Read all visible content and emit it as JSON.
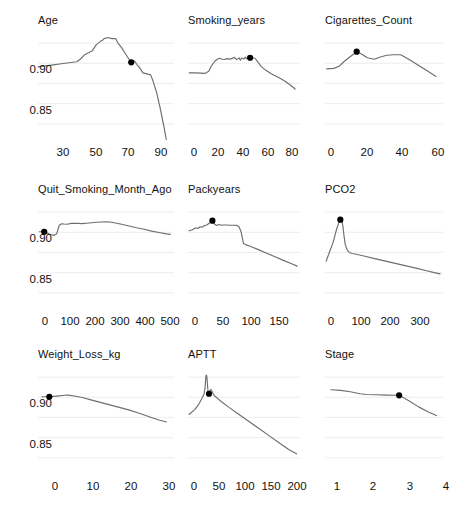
{
  "figure": {
    "kind": "partial-dependence-grid",
    "rows": 3,
    "cols": 3,
    "background_color": "#ffffff",
    "curve_color": "#6e6e6e",
    "marker_color": "#000000",
    "grid_color": "#e9e9ec",
    "text_color": "#111111"
  },
  "chart_data": [
    {
      "type": "line",
      "title": "Age",
      "xlabel": "",
      "ylabel": "",
      "xlim": [
        22,
        92
      ],
      "ylim": [
        0.823,
        0.932
      ],
      "xticks": [
        30,
        50,
        70,
        90
      ],
      "yticks": [
        0.9,
        0.85
      ],
      "ytick_labels": [
        "0.90",
        "0.85"
      ],
      "grid": true,
      "legend": "none",
      "marker_point": {
        "x": 70,
        "y": 0.901
      },
      "x": [
        22,
        26,
        30,
        34,
        38,
        42,
        44,
        46,
        48,
        50,
        52,
        54,
        55,
        56,
        58,
        60,
        62,
        63,
        65,
        67,
        69,
        70,
        71,
        72,
        73,
        74,
        76,
        78,
        80,
        81,
        83,
        85,
        87,
        88
      ],
      "y": [
        0.8965,
        0.8975,
        0.8985,
        0.8995,
        0.9005,
        0.9015,
        0.9045,
        0.9085,
        0.9105,
        0.9125,
        0.9185,
        0.9215,
        0.9225,
        0.9245,
        0.9255,
        0.9245,
        0.9245,
        0.9205,
        0.9155,
        0.9095,
        0.9035,
        0.901,
        0.9025,
        0.9015,
        0.8985,
        0.8965,
        0.8905,
        0.8895,
        0.8885,
        0.8835,
        0.8715,
        0.8545,
        0.8355,
        0.8245
      ]
    },
    {
      "type": "line",
      "title": "Smoking_years",
      "xlabel": "",
      "ylabel": "",
      "xlim": [
        -6,
        86
      ],
      "ylim": [
        0.823,
        0.932
      ],
      "xticks": [
        0,
        20,
        40,
        60,
        80
      ],
      "yticks": [
        0.9,
        0.85
      ],
      "ytick_labels": [
        "0.90",
        "0.85"
      ],
      "grid": true,
      "legend": "none",
      "marker_point": {
        "x": 45,
        "y": 0.9055
      },
      "x": [
        -5,
        0,
        4,
        8,
        11,
        13,
        16,
        18,
        20,
        22,
        24,
        26,
        28,
        30,
        32,
        34,
        36,
        37,
        38,
        40,
        41,
        42,
        44,
        45,
        47,
        49,
        51,
        54,
        58,
        62,
        66,
        70,
        74,
        78,
        82
      ],
      "y": [
        0.8905,
        0.8905,
        0.8902,
        0.89,
        0.892,
        0.897,
        0.902,
        0.904,
        0.905,
        0.904,
        0.9038,
        0.9046,
        0.9042,
        0.9046,
        0.906,
        0.9036,
        0.9054,
        0.903,
        0.9052,
        0.9042,
        0.9062,
        0.9046,
        0.9054,
        0.9055,
        0.9055,
        0.905,
        0.902,
        0.897,
        0.893,
        0.89,
        0.8875,
        0.885,
        0.882,
        0.8785,
        0.8745
      ]
    },
    {
      "type": "line",
      "title": "Cigarettes_Count",
      "xlabel": "",
      "ylabel": "",
      "xlim": [
        -3,
        64
      ],
      "ylim": [
        0.823,
        0.932
      ],
      "xticks": [
        0,
        20,
        40,
        60
      ],
      "yticks": [
        0.9,
        0.85
      ],
      "ytick_labels": [
        "0.90",
        "0.85"
      ],
      "grid": true,
      "legend": "none",
      "marker_point": {
        "x": 15,
        "y": 0.9115
      },
      "x": [
        -2,
        2,
        5,
        8,
        12,
        15,
        18,
        21,
        25,
        28,
        32,
        36,
        40,
        45,
        50,
        55,
        60
      ],
      "y": [
        0.8945,
        0.895,
        0.897,
        0.902,
        0.9075,
        0.9115,
        0.909,
        0.9055,
        0.904,
        0.906,
        0.908,
        0.9085,
        0.9085,
        0.9035,
        0.898,
        0.8925,
        0.887
      ]
    },
    {
      "type": "line",
      "title": "Quit_Smoking_Month_Ago",
      "xlabel": "",
      "ylabel": "",
      "xlim": [
        -25,
        520
      ],
      "ylim": [
        0.823,
        0.932
      ],
      "xticks": [
        0,
        100,
        200,
        300,
        400,
        500
      ],
      "yticks": [
        0.9,
        0.85
      ],
      "ytick_labels": [
        "0.90",
        "0.85"
      ],
      "grid": true,
      "legend": "none",
      "marker_point": {
        "x": 0,
        "y": 0.9005
      },
      "x": [
        -20,
        0,
        10,
        25,
        40,
        50,
        60,
        70,
        80,
        90,
        110,
        130,
        150,
        170,
        190,
        210,
        230,
        250,
        270,
        290,
        310,
        340,
        370,
        400,
        430,
        460,
        490,
        505
      ],
      "y": [
        0.9005,
        0.9005,
        0.8995,
        0.8978,
        0.897,
        0.8985,
        0.907,
        0.9085,
        0.9082,
        0.908,
        0.9088,
        0.909,
        0.9086,
        0.909,
        0.9095,
        0.91,
        0.9102,
        0.9105,
        0.91,
        0.909,
        0.908,
        0.9062,
        0.9045,
        0.903,
        0.9012,
        0.8998,
        0.8985,
        0.898
      ]
    },
    {
      "type": "line",
      "title": "Packyears",
      "xlabel": "",
      "ylabel": "",
      "xlim": [
        -12,
        190
      ],
      "ylim": [
        0.823,
        0.932
      ],
      "xticks": [
        0,
        50,
        100,
        150
      ],
      "yticks": [
        0.9,
        0.85
      ],
      "ytick_labels": [
        "0.90",
        "0.85"
      ],
      "grid": true,
      "legend": "none",
      "marker_point": {
        "x": 32,
        "y": 0.9115
      },
      "x": [
        -10,
        -4,
        2,
        6,
        10,
        14,
        18,
        22,
        26,
        30,
        32,
        36,
        40,
        44,
        48,
        52,
        58,
        64,
        70,
        76,
        80,
        84,
        86,
        88,
        92,
        100,
        115,
        130,
        145,
        160,
        175,
        185
      ],
      "y": [
        0.9015,
        0.9025,
        0.9045,
        0.9038,
        0.9055,
        0.905,
        0.9068,
        0.9072,
        0.909,
        0.9102,
        0.9115,
        0.908,
        0.9068,
        0.9078,
        0.907,
        0.9072,
        0.9072,
        0.907,
        0.907,
        0.9068,
        0.9055,
        0.9,
        0.8945,
        0.889,
        0.8878,
        0.8862,
        0.8828,
        0.8792,
        0.8758,
        0.8722,
        0.8688,
        0.8665
      ]
    },
    {
      "type": "line",
      "title": "PCO2",
      "xlabel": "",
      "ylabel": "",
      "xlim": [
        -18,
        390
      ],
      "ylim": [
        0.823,
        0.932
      ],
      "xticks": [
        0,
        100,
        200,
        300
      ],
      "yticks": [
        0.9,
        0.85
      ],
      "ytick_labels": [
        "0.90",
        "0.85"
      ],
      "grid": true,
      "legend": "none",
      "marker_point": {
        "x": 35,
        "y": 0.9125
      },
      "x": [
        -14,
        10,
        22,
        30,
        35,
        40,
        44,
        48,
        52,
        58,
        66,
        76,
        90,
        120,
        150,
        180,
        210,
        240,
        270,
        300,
        330,
        360,
        380
      ],
      "y": [
        0.8715,
        0.89,
        0.903,
        0.9098,
        0.9125,
        0.912,
        0.906,
        0.896,
        0.888,
        0.8828,
        0.88,
        0.879,
        0.8782,
        0.8762,
        0.8742,
        0.8722,
        0.8702,
        0.8682,
        0.8662,
        0.8642,
        0.8622,
        0.86,
        0.8588
      ]
    },
    {
      "type": "line",
      "title": "Weight_Loss_kg",
      "xlabel": "",
      "ylabel": "",
      "xlim": [
        -3,
        33
      ],
      "ylim": [
        0.823,
        0.932
      ],
      "xticks": [
        0,
        10,
        20,
        30
      ],
      "yticks": [
        0.9,
        0.85
      ],
      "ytick_labels": [
        "0.90",
        "0.85"
      ],
      "grid": true,
      "legend": "none",
      "marker_point": {
        "x": 0,
        "y": 0.9005
      },
      "x": [
        -2,
        0,
        2,
        4,
        5,
        7,
        9,
        11,
        13,
        15,
        18,
        21,
        24,
        27,
        29,
        31
      ],
      "y": [
        0.9005,
        0.9005,
        0.9012,
        0.902,
        0.9022,
        0.901,
        0.8995,
        0.8975,
        0.8955,
        0.8935,
        0.8905,
        0.8875,
        0.884,
        0.88,
        0.8775,
        0.8755
      ]
    },
    {
      "type": "line",
      "title": "APTT",
      "xlabel": "",
      "ylabel": "",
      "xlim": [
        -12,
        212
      ],
      "ylim": [
        0.823,
        0.932
      ],
      "xticks": [
        0,
        50,
        100,
        150,
        200
      ],
      "yticks": [
        0.9,
        0.85
      ],
      "ytick_labels": [
        "0.90",
        "0.85"
      ],
      "grid": true,
      "legend": "none",
      "marker_point": {
        "x": 30,
        "y": 0.9035
      },
      "x": [
        -10,
        2,
        10,
        16,
        20,
        22,
        23,
        24,
        25,
        26,
        27,
        28,
        30,
        32,
        34,
        36,
        40,
        55,
        70,
        90,
        110,
        130,
        150,
        170,
        190,
        205
      ],
      "y": [
        0.883,
        0.888,
        0.8935,
        0.899,
        0.903,
        0.909,
        0.916,
        0.9215,
        0.922,
        0.919,
        0.912,
        0.906,
        0.9035,
        0.9065,
        0.9078,
        0.906,
        0.902,
        0.8955,
        0.89,
        0.883,
        0.876,
        0.869,
        0.862,
        0.855,
        0.848,
        0.844
      ]
    },
    {
      "type": "line",
      "title": "Stage",
      "xlabel": "",
      "ylabel": "",
      "xlim": [
        0.72,
        4.35
      ],
      "ylim": [
        0.823,
        0.932
      ],
      "xticks": [
        1,
        2,
        3,
        4
      ],
      "yticks": [
        0.9,
        0.85
      ],
      "ytick_labels": [
        "0.90",
        "0.85"
      ],
      "grid": true,
      "legend": "none",
      "marker_point": {
        "x": 3,
        "y": 0.902
      },
      "x": [
        0.9,
        1.2,
        1.5,
        1.8,
        2.0,
        2.3,
        2.6,
        3.0,
        3.3,
        3.6,
        3.9,
        4.15
      ],
      "y": [
        0.9075,
        0.9068,
        0.9055,
        0.9035,
        0.9028,
        0.9025,
        0.9022,
        0.902,
        0.8965,
        0.8905,
        0.8855,
        0.882
      ]
    }
  ]
}
